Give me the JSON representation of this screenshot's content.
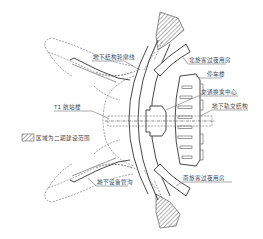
{
  "diagram": {
    "labels": {
      "underground_outline": "地下结构轮廓线",
      "north_overnight_rooms": "北旅客过夜用房",
      "parking_building": "停车楼",
      "transport_hub": "交通换乘中心",
      "underground_rail": "地下轨交结构",
      "t1_terminal": "T1 航站楼",
      "phase2_legend": "区域为二期建设范围",
      "underground_utility_tunnel": "地下设备管沟",
      "south_overnight_rooms": "南旅客过夜用房"
    },
    "colors": {
      "line": "#333333",
      "hatch": "#555555",
      "text": "#444444",
      "background": "#ffffff"
    }
  }
}
